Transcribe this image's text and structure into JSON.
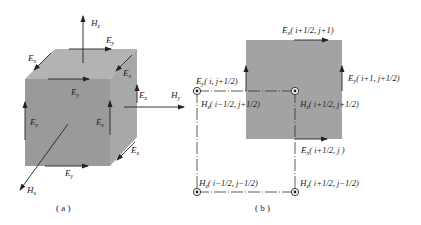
{
  "figure": {
    "panel_a": {
      "caption": "( a )",
      "labels": {
        "hz_top": {
          "main": "H",
          "sub": "z"
        },
        "ey_top": {
          "main": "E",
          "sub": "y"
        },
        "ex_topleft": {
          "main": "E",
          "sub": "x"
        },
        "ex_topright": {
          "main": "E",
          "sub": "x"
        },
        "ey_front": {
          "main": "E",
          "sub": "y"
        },
        "ez_rightface": {
          "main": "E",
          "sub": "z"
        },
        "ez_left": {
          "main": "E",
          "sub": "z"
        },
        "ez_frontright": {
          "main": "E",
          "sub": "z"
        },
        "ex_bottomright": {
          "main": "E",
          "sub": "x"
        },
        "ey_bottom": {
          "main": "E",
          "sub": "y"
        },
        "hx": {
          "main": "H",
          "sub": "x"
        },
        "hy": {
          "main": "H",
          "sub": "y"
        }
      }
    },
    "panel_b": {
      "caption": "( b )",
      "labels": {
        "ex_top": {
          "main": "E",
          "sub": "x",
          "idx": "( i+1/2, j+1)"
        },
        "ey_left": {
          "main": "E",
          "sub": "y",
          "idx": "( i, j+1/2)"
        },
        "ey_right": {
          "main": "E",
          "sub": "y",
          "idx": "( i+1, j+1/2)"
        },
        "hz_tl": {
          "main": "H",
          "sub": "z",
          "idx": "( i−1/2, j+1/2)"
        },
        "hz_tr": {
          "main": "H",
          "sub": "z",
          "idx": "( i+1/2, j+1/2)"
        },
        "ex_bottom": {
          "main": "E",
          "sub": "x",
          "idx": "( i+1/2, j )"
        },
        "hz_bl": {
          "main": "H",
          "sub": "z",
          "idx": "( i−1/2, j−1/2)"
        },
        "hz_br": {
          "main": "H",
          "sub": "z",
          "idx": "( i+1/2, j−1/2)"
        }
      }
    },
    "colors": {
      "front_face": "#9a9a9a",
      "top_face": "#b3b3b3",
      "side_face": "#a8a8a8",
      "square": "#a3a3a3",
      "line": "#222222"
    }
  }
}
